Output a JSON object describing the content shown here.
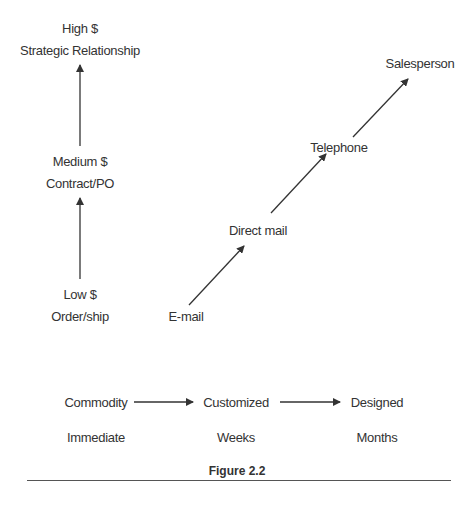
{
  "vertical_axis": {
    "levels": [
      {
        "value": "High $",
        "type": "Strategic Relationship"
      },
      {
        "value": "Medium $",
        "type": "Contract/PO"
      },
      {
        "value": "Low $",
        "type": "Order/ship"
      }
    ]
  },
  "channels": [
    "E-mail",
    "Direct mail",
    "Telephone",
    "Salesperson"
  ],
  "horizontal_axis": {
    "products": [
      "Commodity",
      "Customized",
      "Designed"
    ],
    "timeframes": [
      "Immediate",
      "Weeks",
      "Months"
    ]
  },
  "caption": "Figure 2.2",
  "colors": {
    "text": "#333333",
    "line": "#333333",
    "background": "#ffffff"
  }
}
